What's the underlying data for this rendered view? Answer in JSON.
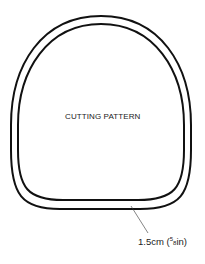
{
  "diagram": {
    "title": "CUTTING PATTERN",
    "seam_allowance_label": "1.5cm (",
    "seam_fraction_num": "5",
    "seam_fraction_den": "8",
    "seam_unit_suffix": "in)",
    "stroke_color": "#111111"
  }
}
